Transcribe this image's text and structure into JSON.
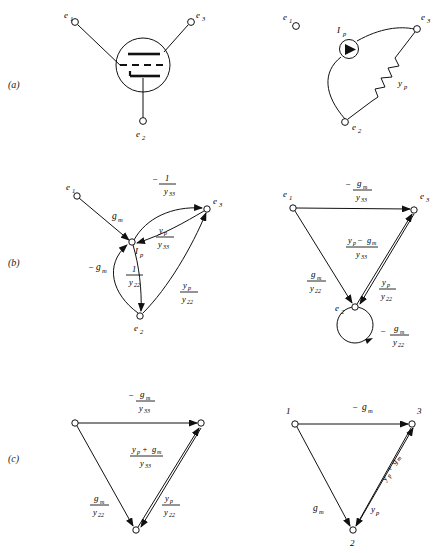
{
  "figure": {
    "caption_rows": [
      {
        "id": "a",
        "label": "(a)"
      },
      {
        "id": "b",
        "label": "(b)"
      },
      {
        "id": "c",
        "label": "(c)"
      }
    ]
  },
  "panel_a_left": {
    "name": "triode-vacuum-tube-circuit",
    "nodes": [
      {
        "id": "e1",
        "label": "e",
        "sub": "1"
      },
      {
        "id": "e3",
        "label": "e",
        "sub": "3"
      },
      {
        "id": "e2",
        "label": "e",
        "sub": "2"
      }
    ],
    "symbol": "triode-tube"
  },
  "panel_a_right": {
    "name": "small-signal-equivalent-circuit",
    "nodes": [
      {
        "id": "e1",
        "label": "e",
        "sub": "1"
      },
      {
        "id": "e3",
        "label": "e",
        "sub": "3"
      },
      {
        "id": "e2",
        "label": "e",
        "sub": "2"
      }
    ],
    "elements": [
      {
        "id": "current-source",
        "label": "I",
        "sub": "p",
        "type": "current-source"
      },
      {
        "id": "plate-admittance",
        "label": "y",
        "sub": "p",
        "type": "resistor"
      }
    ]
  },
  "panel_b_left": {
    "name": "signal-flow-graph-full",
    "nodes": [
      {
        "id": "e1",
        "label": "e",
        "sub": "1"
      },
      {
        "id": "e3",
        "label": "e",
        "sub": "3"
      },
      {
        "id": "e2",
        "label": "e",
        "sub": "2"
      },
      {
        "id": "ip",
        "label": "I",
        "sub": "p"
      }
    ],
    "edges": [
      {
        "id": "e1-ip",
        "from": "e1",
        "to": "ip",
        "gain": {
          "text": "g",
          "sub": "m",
          "sign": ""
        }
      },
      {
        "id": "ip-e3",
        "from": "ip",
        "to": "e3",
        "gain": {
          "num": "1",
          "den_base": "y",
          "den_sub": "33",
          "sign": "−"
        }
      },
      {
        "id": "e3-ip",
        "from": "e3",
        "to": "ip",
        "gain": {
          "num_base": "y",
          "num_sub": "p",
          "den_base": "y",
          "den_sub": "33"
        }
      },
      {
        "id": "ip-e2",
        "from": "ip",
        "to": "e2",
        "gain": {
          "num": "1",
          "den_base": "y",
          "den_sub": "22"
        }
      },
      {
        "id": "e2-ip",
        "from": "e2",
        "to": "ip",
        "gain": {
          "text": "g",
          "sub": "m",
          "sign": "−"
        }
      },
      {
        "id": "e2-e3",
        "from": "e2",
        "to": "e3",
        "gain": {
          "num_base": "y",
          "num_sub": "p",
          "den_base": "y",
          "den_sub": "22"
        }
      }
    ]
  },
  "panel_b_right": {
    "name": "signal-flow-graph-reduced-with-selfloop",
    "nodes": [
      {
        "id": "e1",
        "label": "e",
        "sub": "1"
      },
      {
        "id": "e3",
        "label": "e",
        "sub": "3"
      },
      {
        "id": "e2",
        "label": "e",
        "sub": "2"
      }
    ],
    "edges": [
      {
        "id": "e1-e3",
        "from": "e1",
        "to": "e3",
        "gain": {
          "num_base": "g",
          "num_sub": "m",
          "den_base": "y",
          "den_sub": "33",
          "sign": "−"
        }
      },
      {
        "id": "e1-e2",
        "from": "e1",
        "to": "e2",
        "gain": {
          "num_base": "g",
          "num_sub": "m",
          "den_base": "y",
          "den_sub": "22"
        }
      },
      {
        "id": "e2-e3",
        "from": "e2",
        "to": "e3",
        "gain": {
          "num_a": "y",
          "num_a_sub": "p",
          "op": "−",
          "num_b": "g",
          "num_b_sub": "m",
          "den_base": "y",
          "den_sub": "33"
        }
      },
      {
        "id": "e3-e2",
        "from": "e3",
        "to": "e2",
        "gain": {
          "num_base": "y",
          "num_sub": "p",
          "den_base": "y",
          "den_sub": "22"
        }
      },
      {
        "id": "e2-self",
        "from": "e2",
        "to": "e2",
        "gain": {
          "num_base": "g",
          "num_sub": "m",
          "den_base": "y",
          "den_sub": "22",
          "sign": "−"
        }
      }
    ]
  },
  "panel_c_left": {
    "name": "signal-flow-graph-simplified",
    "nodes": [
      {
        "id": "n1",
        "label": ""
      },
      {
        "id": "n3",
        "label": ""
      },
      {
        "id": "n2",
        "label": ""
      }
    ],
    "edges": [
      {
        "id": "n1-n3",
        "from": "n1",
        "to": "n3",
        "gain": {
          "num_base": "g",
          "num_sub": "m",
          "den_base": "y",
          "den_sub": "33",
          "sign": "−"
        }
      },
      {
        "id": "n1-n2",
        "from": "n1",
        "to": "n2",
        "gain": {
          "num_base": "g",
          "num_sub": "m",
          "den_base": "y",
          "den_sub": "22"
        }
      },
      {
        "id": "n2-n3",
        "from": "n2",
        "to": "n3",
        "gain": {
          "num_a": "y",
          "num_a_sub": "p",
          "op": "+",
          "num_b": "g",
          "num_b_sub": "m",
          "den_base": "y",
          "den_sub": "33"
        }
      },
      {
        "id": "n3-n2",
        "from": "n3",
        "to": "n2",
        "gain": {
          "num_base": "y",
          "num_sub": "p",
          "den_base": "y",
          "den_sub": "22"
        }
      }
    ]
  },
  "panel_c_right": {
    "name": "signal-flow-graph-final",
    "nodes": [
      {
        "id": "n1",
        "label": "1"
      },
      {
        "id": "n3",
        "label": "3"
      },
      {
        "id": "n2",
        "label": "2"
      }
    ],
    "edges": [
      {
        "id": "n1-n3",
        "from": "n1",
        "to": "n3",
        "gain": {
          "text": "g",
          "sub": "m",
          "sign": "−"
        }
      },
      {
        "id": "n1-n2",
        "from": "n1",
        "to": "n2",
        "gain": {
          "text": "g",
          "sub": "m"
        }
      },
      {
        "id": "n3-n2",
        "from": "n3",
        "to": "n2",
        "gain": {
          "text": "y",
          "sub": "p"
        }
      },
      {
        "id": "n2-n3",
        "from": "n2",
        "to": "n3",
        "gain": {
          "a": "y",
          "a_sub": "p",
          "op": "+",
          "b": "g",
          "b_sub": "m"
        }
      }
    ]
  },
  "labels": {
    "e": "e",
    "y": "y",
    "g": "g",
    "I": "I",
    "one": "1",
    "minus": "−",
    "plus": "+",
    "sub_1": "1",
    "sub_2": "2",
    "sub_3": "3",
    "sub_m": "m",
    "sub_p": "p",
    "sub_22": "22",
    "sub_33": "33",
    "node_1": "1",
    "node_2": "2",
    "node_3": "3",
    "row_a": "(a)",
    "row_b": "(b)",
    "row_c": "(c)"
  },
  "colors": {
    "ink": "#111111",
    "background": "#ffffff",
    "faint": "#cfcfcf"
  }
}
